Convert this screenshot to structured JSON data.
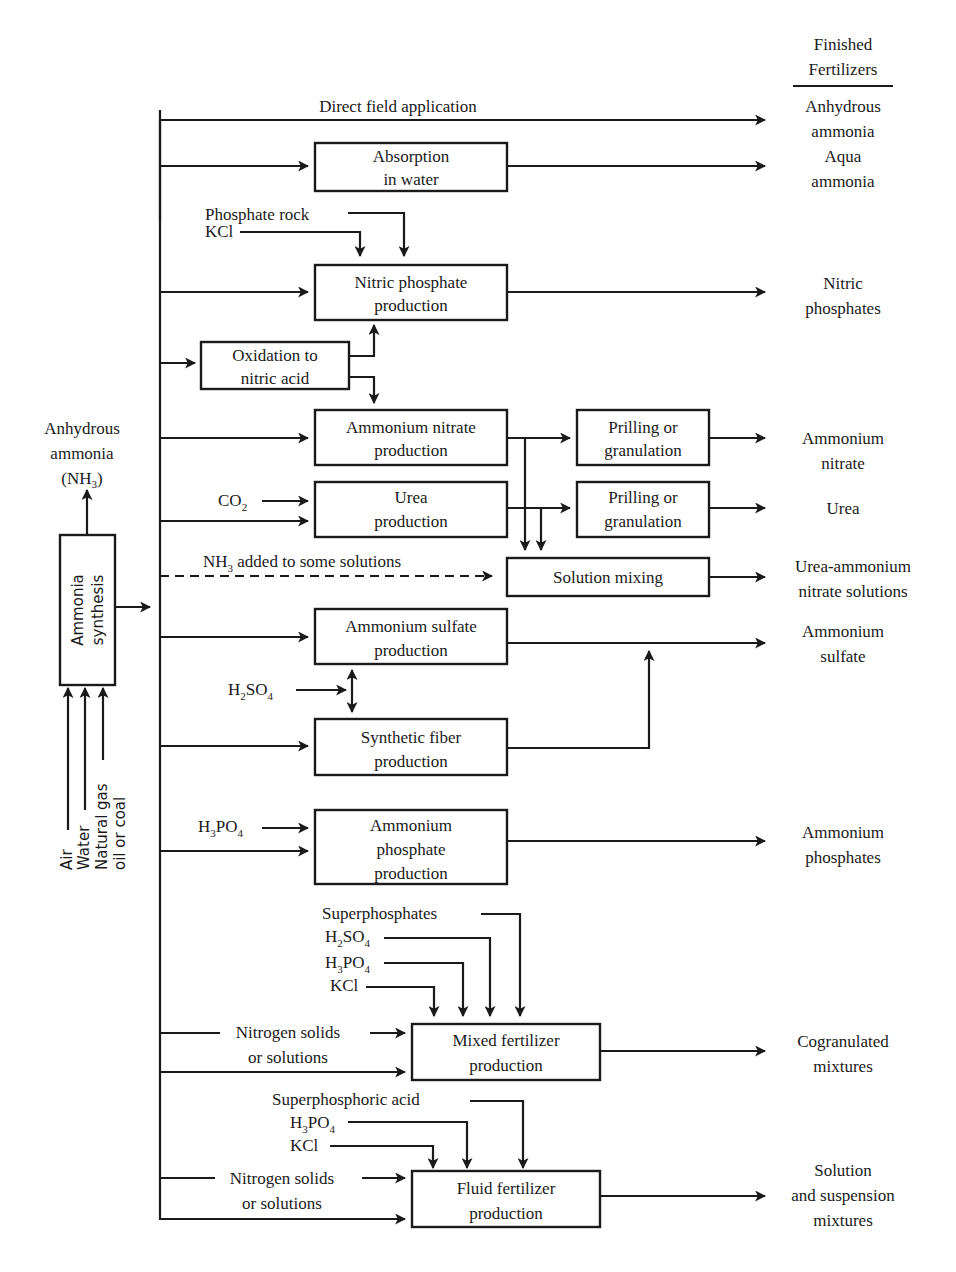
{
  "header": {
    "title_line1": "Finished",
    "title_line2": "Fertilizers"
  },
  "source": {
    "box_line1": "Ammonia",
    "box_line2": "synthesis",
    "inputs": [
      "Air",
      "Water",
      "Natural gas",
      "oil or coal"
    ],
    "output_line1": "Anhydrous",
    "output_line2": "ammonia",
    "output_line3_prefix": "(NH",
    "output_line3_sub": "3",
    "output_line3_suffix": ")"
  },
  "direct": {
    "label": "Direct field application"
  },
  "processes": {
    "absorption": {
      "line1": "Absorption",
      "line2": "in water"
    },
    "nitric_phosphate": {
      "line1": "Nitric phosphate",
      "line2": "production"
    },
    "oxidation": {
      "line1": "Oxidation to",
      "line2": "nitric acid"
    },
    "ammonium_nitrate": {
      "line1": "Ammonium nitrate",
      "line2": "production"
    },
    "prilling_an": {
      "line1": "Prilling or",
      "line2": "granulation"
    },
    "urea": {
      "line1": "Urea",
      "line2": "production"
    },
    "prilling_urea": {
      "line1": "Prilling or",
      "line2": "granulation"
    },
    "solution_mixing": {
      "line1": "Solution mixing"
    },
    "ammonium_sulfate": {
      "line1": "Ammonium sulfate",
      "line2": "production"
    },
    "synthetic_fiber": {
      "line1": "Synthetic fiber",
      "line2": "production"
    },
    "ammonium_phosphate": {
      "line1": "Ammonium",
      "line2": "phosphate",
      "line3": "production"
    },
    "mixed_fertilizer": {
      "line1": "Mixed fertilizer",
      "line2": "production"
    },
    "fluid_fertilizer": {
      "line1": "Fluid fertilizer",
      "line2": "production"
    }
  },
  "inputs": {
    "phosphate_rock": "Phosphate rock",
    "kcl": "KCl",
    "co2_main": "CO",
    "co2_sub": "2",
    "nh3_dashed_main": "NH",
    "nh3_dashed_sub": "3",
    "nh3_dashed_rest": " added to some solutions",
    "h2so4": {
      "a": "H",
      "b": "2",
      "c": "SO",
      "d": "4"
    },
    "h3po4": {
      "a": "H",
      "b": "3",
      "c": "PO",
      "d": "4"
    },
    "superphosphates": "Superphosphates",
    "superphosphoric_acid": "Superphosphoric acid",
    "nitrogen_solids_line1": "Nitrogen solids",
    "nitrogen_solids_line2": "or solutions"
  },
  "products": {
    "anhydrous_ammonia": {
      "line1": "Anhydrous",
      "line2": "ammonia"
    },
    "aqua_ammonia": {
      "line1": "Aqua",
      "line2": "ammonia"
    },
    "nitric_phosphates": {
      "line1": "Nitric",
      "line2": "phosphates"
    },
    "ammonium_nitrate": {
      "line1": "Ammonium",
      "line2": "nitrate"
    },
    "urea": {
      "line1": "Urea"
    },
    "uan": {
      "line1": "Urea-ammonium",
      "line2": "nitrate solutions"
    },
    "ammonium_sulfate": {
      "line1": "Ammonium",
      "line2": "sulfate"
    },
    "ammonium_phosphates": {
      "line1": "Ammonium",
      "line2": "phosphates"
    },
    "cogranulated": {
      "line1": "Cogranulated",
      "line2": "mixtures"
    },
    "solution_suspension": {
      "line1": "Solution",
      "line2": "and suspension",
      "line3": "mixtures"
    }
  }
}
